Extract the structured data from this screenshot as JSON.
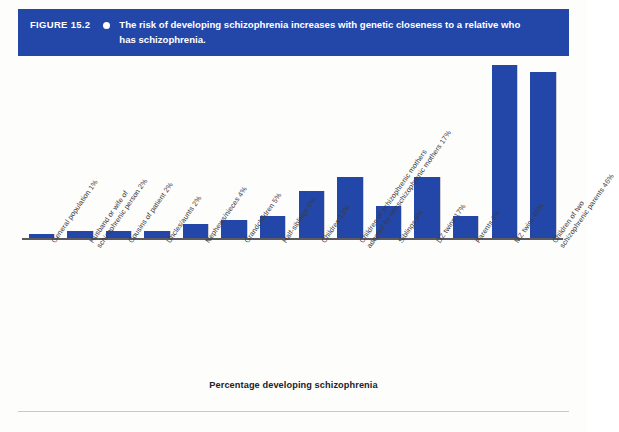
{
  "figure": {
    "number": "FIGURE 15.2",
    "bullet_icon": "bullet-dot-icon",
    "caption": "The risk of developing schizophrenia increases with genetic closeness to a relative who has schizophrenia.",
    "banner_color": "#2347a8"
  },
  "chart_data": {
    "type": "bar",
    "title": "The risk of developing schizophrenia increases with genetic closeness to a relative who has schizophrenia.",
    "xlabel": "Percentage developing schizophrenia",
    "ylabel": "",
    "ylim": [
      0,
      50
    ],
    "grid": false,
    "legend": "none",
    "bar_color": "#2347a8",
    "categories": [
      "General population 1%",
      "Husband or wife of schizophrenic person 2%",
      "Cousins of patient 2%",
      "Uncles/aunts 2%",
      "Nephews/nieces 4%",
      "Grandchildren 5%",
      "Half-siblings 6%",
      "Children 13%",
      "Children of schizophrenic mothers adopted by nonschizophrenic mothers 17%",
      "Siblings 9%",
      "DZ twins 17%",
      "Parents 6%",
      "MZ twins 48%",
      "Children of two schizophrenic parents 46%"
    ],
    "category_lines": [
      [
        "General population 1%"
      ],
      [
        "Husband or wife of",
        "schizophrenic person 2%"
      ],
      [
        "Cousins of patient 2%"
      ],
      [
        "Uncles/aunts 2%"
      ],
      [
        "Nephews/nieces 4%"
      ],
      [
        "Grandchildren 5%"
      ],
      [
        "Half-siblings 6%"
      ],
      [
        "Children 13%"
      ],
      [
        "Children of schizophrenic mothers",
        "adopted by nonschizophrenic mothers 17%"
      ],
      [
        "Siblings 9%"
      ],
      [
        "DZ twins 17%"
      ],
      [
        "Parents 6%"
      ],
      [
        "MZ twins 48%"
      ],
      [
        "Children of two",
        "schizophrenic parents 46%"
      ]
    ],
    "values": [
      1,
      2,
      2,
      2,
      4,
      5,
      6,
      13,
      17,
      9,
      17,
      6,
      48,
      46
    ]
  },
  "axis": {
    "x_title": "Percentage developing schizophrenia"
  }
}
